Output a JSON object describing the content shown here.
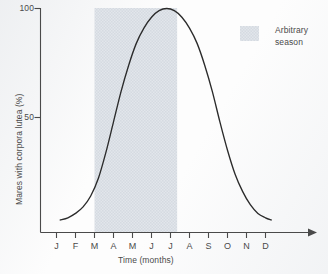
{
  "chart_data": {
    "type": "line",
    "title": "",
    "subtitle": "",
    "xlabel": "Time (months)",
    "ylabel": "Mares with corpora lutea (%)",
    "xlim": [
      0,
      13
    ],
    "ylim": [
      0,
      100
    ],
    "grid": false,
    "legend_position": "top-right",
    "x_tick_labels": [
      "J",
      "F",
      "M",
      "A",
      "M",
      "J",
      "J",
      "A",
      "S",
      "O",
      "N",
      "D"
    ],
    "x_tick_values": [
      1,
      2,
      3,
      4,
      5,
      6,
      7,
      8,
      9,
      10,
      11,
      12
    ],
    "y_tick_labels": [
      "50",
      "100"
    ],
    "y_tick_values": [
      50,
      100
    ],
    "x_axis_arrow": true,
    "series": [
      {
        "name": "Mares with corpora lutea",
        "color": "#2b2b2b",
        "x": [
          1.2,
          1.6,
          2.0,
          2.4,
          2.8,
          3.2,
          3.6,
          4.0,
          4.4,
          4.8,
          5.2,
          5.6,
          6.0,
          6.4,
          6.8,
          7.2,
          7.6,
          8.0,
          8.4,
          8.8,
          9.2,
          9.6,
          10.0,
          10.4,
          10.8,
          11.2,
          11.6,
          12.0,
          12.3
        ],
        "values": [
          3,
          4,
          6,
          9,
          14,
          22,
          34,
          48,
          62,
          74,
          84,
          91,
          96,
          99,
          100,
          99,
          96,
          91,
          84,
          74,
          62,
          48,
          35,
          24,
          16,
          10,
          6,
          4,
          3
        ]
      }
    ],
    "shaded_regions": [
      {
        "label": "Arbitrary season",
        "x_start": 3.0,
        "x_end": 7.35,
        "color": "#dfe4ea"
      }
    ],
    "annotations": []
  },
  "legend": {
    "entries": [
      {
        "label_line1": "Arbitrary",
        "label_line2": "season",
        "swatch_color": "#dfe4ea"
      }
    ]
  },
  "icons": {
    "axis_arrow": "arrow-right-icon"
  }
}
